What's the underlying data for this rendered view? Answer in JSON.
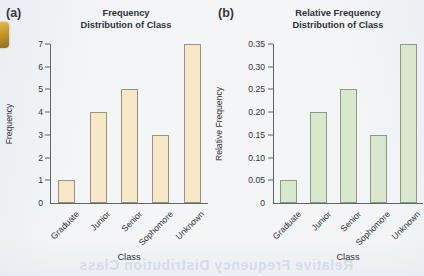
{
  "page": {
    "background_color": "#f3f5f7",
    "edge_tab_color": "#c99a28",
    "ghost_text": "Relative Frequency Distribution Class"
  },
  "panels": [
    {
      "letter": "(a)",
      "bar_color": "#f6e8c5",
      "bar_border_color": "#9a9383",
      "title_line1": "Frequency",
      "title_line2": "Distribution of Class",
      "chart_data": {
        "type": "bar",
        "title": "Frequency Distribution of Class",
        "xlabel": "Class",
        "ylabel": "Frequency",
        "categories": [
          "Graduate",
          "Junior",
          "Senior",
          "Sophomore",
          "Unknown"
        ],
        "values": [
          1,
          4,
          5,
          3,
          7
        ],
        "ylim": [
          0,
          7
        ],
        "yticks": [
          0,
          1,
          2,
          3,
          4,
          5,
          6,
          7
        ],
        "ytick_labels": [
          "0",
          "1",
          "2",
          "3",
          "4",
          "5",
          "6",
          "7"
        ],
        "grid": false,
        "legend": "none"
      }
    },
    {
      "letter": "(b)",
      "bar_color": "#d9e7cd",
      "bar_border_color": "#8e9a86",
      "title_line1": "Relative Frequency",
      "title_line2": "Distribution of Class",
      "chart_data": {
        "type": "bar",
        "title": "Relative Frequency Distribution of Class",
        "xlabel": "Class",
        "ylabel": "Relative Frequency",
        "categories": [
          "Graduate",
          "Junior",
          "Senior",
          "Sophomore",
          "Unknown"
        ],
        "values": [
          0.05,
          0.2,
          0.25,
          0.15,
          0.35
        ],
        "ylim": [
          0,
          0.35
        ],
        "yticks": [
          0,
          0.05,
          0.1,
          0.15,
          0.2,
          0.25,
          0.3,
          0.35
        ],
        "ytick_labels": [
          "0",
          "0.05",
          "0.10",
          "0.15",
          "0.20",
          "0.25",
          "0.30",
          "0.35"
        ],
        "grid": false,
        "legend": "none"
      }
    }
  ]
}
